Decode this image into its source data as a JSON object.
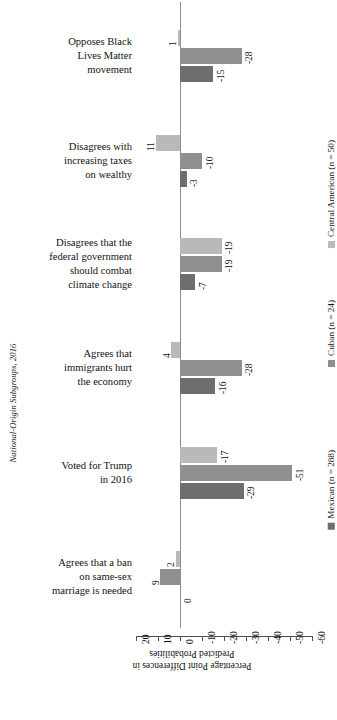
{
  "chart_data": {
    "type": "bar",
    "title": "",
    "orientation": "horizontal-grouped",
    "xlabel": "Percentage Point Differences in Predicted Probabilities",
    "ylabel": "National-Origin Subgroups, 2016",
    "xlim": [
      20,
      -60
    ],
    "xticks": [
      20,
      10,
      0,
      -10,
      -20,
      -30,
      -40,
      -50,
      -60
    ],
    "xtick_labels": [
      "20",
      "10",
      "0",
      "-10",
      "-20",
      "-30",
      "-40",
      "-50",
      "-60"
    ],
    "grid": false,
    "legend_position": "right",
    "categories": [
      "Opposes Black Lives Matter movement",
      "Disagrees with increasing taxes on wealthy",
      "Disagrees that the federal government should combat climate change",
      "Agrees that immigrants hurt the economy",
      "Voted for Trump in 2016",
      "Agrees that a ban on same-sex marriage is needed"
    ],
    "series": [
      {
        "name": "Central American (n = 50)",
        "color": "#b9b9b9",
        "values": [
          1,
          11,
          -19,
          4,
          -17,
          2
        ]
      },
      {
        "name": "Cuban (n = 24)",
        "color": "#8f8f8f",
        "values": [
          -28,
          -10,
          -19,
          -28,
          -51,
          9
        ]
      },
      {
        "name": "Mexican (n = 288)",
        "color": "#6e6e6e",
        "values": [
          -15,
          -3,
          -7,
          -16,
          -29,
          0
        ]
      }
    ],
    "value_labels": [
      [
        "1",
        "-28",
        "-15"
      ],
      [
        "11",
        "-10",
        "-3"
      ],
      [
        "-19",
        "-19",
        "-7"
      ],
      [
        "4",
        "-28",
        "-16"
      ],
      [
        "-17",
        "-51",
        "-29"
      ],
      [
        "2",
        "9",
        "0"
      ]
    ]
  },
  "axis": {
    "x_title_line1": "Percentage Point Differences in",
    "x_title_line2": "Predicted Probabilities",
    "y_title": "National-Origin Subgroups, 2016"
  },
  "category_labels": [
    {
      "lines": [
        "Opposes Black",
        "Lives Matter",
        "movement"
      ]
    },
    {
      "lines": [
        "Disagrees with",
        "increasing taxes",
        "on wealthy"
      ]
    },
    {
      "lines": [
        "Disagrees that the",
        "federal government",
        "should combat",
        "climate change"
      ]
    },
    {
      "lines": [
        "Agrees that",
        "immigrants hurt",
        "the economy"
      ]
    },
    {
      "lines": [
        "Voted for Trump",
        "in 2016"
      ]
    },
    {
      "lines": [
        "Agrees that a ban",
        "on same-sex",
        "marriage is needed"
      ]
    }
  ],
  "legend": {
    "items": [
      {
        "label": "Central American (n = 50)",
        "color": "#b9b9b9"
      },
      {
        "label": "Cuban (n = 24)",
        "color": "#8f8f8f"
      },
      {
        "label": "Mexican (n = 288)",
        "color": "#6e6e6e"
      }
    ]
  }
}
